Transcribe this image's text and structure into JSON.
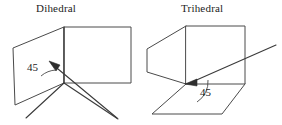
{
  "figure": {
    "width": 282,
    "height": 125,
    "background_color": "#ffffff",
    "stroke_color": "#4a4a4a",
    "text_color": "#1c1c1c",
    "panels": [
      {
        "id": "dihedral",
        "title": "Dihedral",
        "angle_label": "45",
        "angle_units": "degrees",
        "description": "Two planar faces meeting along a shared vertical edge; an arrow points to the junction vertex and an arc marks the 45 angle."
      },
      {
        "id": "trihedral",
        "title": "Trihedral",
        "angle_label": "45",
        "angle_units": "degrees",
        "description": "Three planar faces meeting at a single corner of a box; an arrow points to the corner vertex and an arc marks the 45 angle."
      }
    ]
  },
  "labels": {
    "dihedral_title": "Dihedral",
    "trihedral_title": "Trihedral",
    "dihedral_angle": "45",
    "trihedral_angle": "45"
  }
}
